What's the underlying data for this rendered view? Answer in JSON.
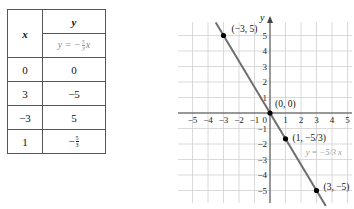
{
  "table": {
    "x_header": "x",
    "y_header": "y",
    "equation": {
      "prefix": "y = −",
      "num": "5",
      "den": "3",
      "suffix": "x"
    },
    "rows": [
      {
        "x": "0",
        "y": "0"
      },
      {
        "x": "3",
        "y": "−5"
      },
      {
        "x": "−3",
        "y": "5"
      },
      {
        "x": "1",
        "y_frac": {
          "sign": "−",
          "num": "5",
          "den": "3"
        }
      }
    ]
  },
  "chart_data": {
    "type": "line",
    "title": "",
    "xlabel": "",
    "ylabel": "y",
    "xlim": [
      -5,
      5
    ],
    "ylim": [
      -5,
      5
    ],
    "grid": true,
    "x_ticks": [
      -5,
      -4,
      -3,
      -2,
      -1,
      1,
      2,
      3,
      4,
      5
    ],
    "y_ticks": [
      -5,
      -4,
      -3,
      -2,
      -1,
      1,
      2,
      3,
      4,
      5
    ],
    "origin_label": "0",
    "series": [
      {
        "name": "y = −5/3 x",
        "slope": -1.6667,
        "intercept": 0,
        "x_range": [
          -3.5,
          3.6
        ],
        "color": "#6e6e6e"
      }
    ],
    "points": [
      {
        "x": -3,
        "y": 5,
        "label": "(−3, 5)"
      },
      {
        "x": 0,
        "y": 0,
        "label": "(0, 0)"
      },
      {
        "x": 1,
        "y": -1.6667,
        "label": "(1, −5/3)"
      },
      {
        "x": 3,
        "y": -5,
        "label": "(3, −5)"
      }
    ],
    "line_label": {
      "text": "y = −5/3 x",
      "color": "#9a9a9a"
    },
    "grid_color": "#d0d0d0",
    "axis_color": "#444444",
    "point_color": "#000000"
  }
}
